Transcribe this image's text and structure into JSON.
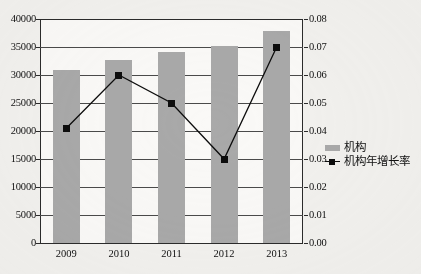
{
  "chart_data": {
    "type": "bar",
    "title": "",
    "xlabel": "",
    "ylabel": "",
    "grid": true,
    "legend_position": "right",
    "categories": [
      "2009",
      "2010",
      "2011",
      "2012",
      "2013"
    ],
    "series": [
      {
        "name": "机构",
        "type": "bar",
        "axis": "left",
        "color": "#a9a9a9",
        "values": [
          30900,
          32700,
          34100,
          35200,
          37800
        ]
      },
      {
        "name": "机构年增长率",
        "type": "line",
        "axis": "right",
        "color": "#0d0d0d",
        "marker": "square",
        "values": [
          0.041,
          0.06,
          0.05,
          0.03,
          0.07
        ]
      }
    ],
    "left_axis": {
      "min": 0,
      "max": 40000,
      "step": 5000,
      "ticks": [
        "0",
        "5000",
        "10000",
        "15000",
        "20000",
        "25000",
        "30000",
        "35000",
        "40000"
      ]
    },
    "right_axis": {
      "min": 0.0,
      "max": 0.08,
      "step": 0.01,
      "ticks": [
        "0.00",
        "0.01",
        "0.02",
        "0.03",
        "0.04",
        "0.05",
        "0.06",
        "0.07",
        "0.08"
      ]
    },
    "legend": [
      {
        "label": "机构",
        "marker": "bar-swatch"
      },
      {
        "label": "机构年增长率",
        "marker": "line-square-swatch"
      }
    ]
  }
}
